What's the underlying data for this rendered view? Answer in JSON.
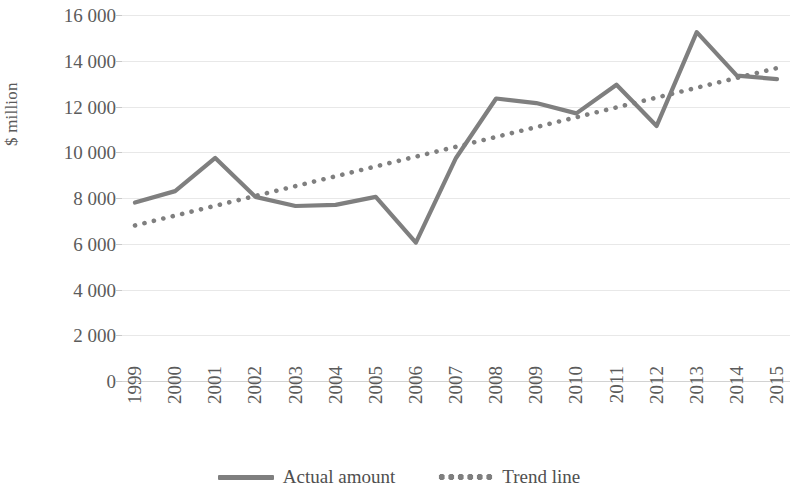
{
  "chart_data": {
    "type": "line",
    "title": "",
    "xlabel": "",
    "ylabel": "$ million",
    "ylim": [
      0,
      16000
    ],
    "ytick_values": [
      0,
      2000,
      4000,
      6000,
      8000,
      10000,
      12000,
      14000,
      16000
    ],
    "ytick_labels": [
      "0",
      "2 000",
      "4 000",
      "6 000",
      "8 000",
      "10 000",
      "12 000",
      "14 000",
      "16 000"
    ],
    "grid": true,
    "legend_position": "bottom",
    "x_labels_rotation": -90,
    "categories": [
      "1999",
      "2000",
      "2001",
      "2002",
      "2003",
      "2004",
      "2005",
      "2006",
      "2007",
      "2008",
      "2009",
      "2010",
      "2011",
      "2012",
      "2013",
      "2014",
      "2015"
    ],
    "series": [
      {
        "name": "Actual amount",
        "style": "solid",
        "color": "#7f7f7f",
        "values": [
          7800,
          8300,
          9750,
          8050,
          7650,
          7700,
          8050,
          6050,
          9750,
          12350,
          12150,
          11700,
          12950,
          11150,
          15250,
          13350,
          13200
        ]
      },
      {
        "name": "Trend line",
        "style": "dotted",
        "color": "#7f7f7f",
        "values": [
          6800,
          7230,
          7660,
          8090,
          8520,
          8950,
          9380,
          9810,
          10240,
          10670,
          11100,
          11530,
          11960,
          12390,
          12820,
          13250,
          13680
        ]
      }
    ]
  },
  "axis": {
    "y_title": "$ million"
  },
  "legend": {
    "items": [
      {
        "label": "Actual amount",
        "swatch": "solid-line-swatch"
      },
      {
        "label": "Trend line",
        "swatch": "dotted-line-swatch"
      }
    ]
  }
}
